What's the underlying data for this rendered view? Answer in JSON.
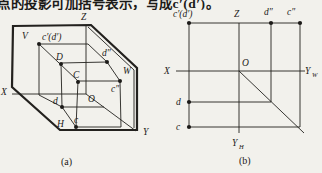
{
  "page": {
    "background": "#f2f1ec",
    "ink": "#1c1a18"
  },
  "header": {
    "clipped_text": "点的投影可加括号表示，写成c′(d′)。"
  },
  "figure": {
    "caption_a": "(a)",
    "caption_b": "(b)",
    "panel_a": {
      "plane_labels": {
        "v": "V",
        "h": "H",
        "w": "W"
      },
      "axis_labels": {
        "x": "X",
        "y": "Y",
        "z": "Z",
        "origin": "O"
      },
      "point_labels": {
        "c_front": "c′(d′)",
        "space_d": "D",
        "space_c": "C",
        "d_profile": "d″",
        "c_profile": "c″",
        "d_horiz": "d",
        "c_horiz": "c"
      }
    },
    "panel_b": {
      "axis_labels": {
        "x": "X",
        "z": "Z",
        "origin": "O",
        "yw_main": "Y",
        "yw_sub": "W",
        "yh_main": "Y",
        "yh_sub": "H"
      },
      "point_labels": {
        "c_front": "c′(d′)",
        "d_profile": "d″",
        "c_profile": "c″",
        "d_horiz": "d",
        "c_horiz": "c"
      }
    }
  }
}
